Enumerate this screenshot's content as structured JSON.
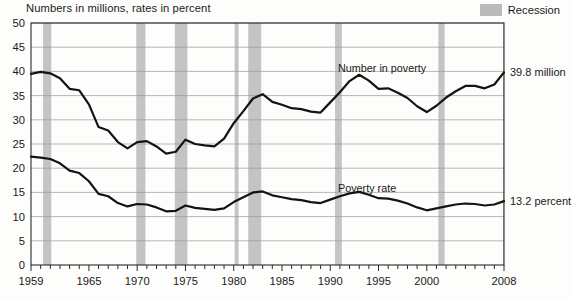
{
  "header": {
    "axis_note": "Numbers in millions, rates in percent",
    "legend": {
      "label": "Recession",
      "swatch_color": "#c2c4c6"
    }
  },
  "annotations": {
    "series1_label": "Number in poverty",
    "series1_end_label": "39.8 million",
    "series2_label": "Poverty rate",
    "series2_end_label": "13.2 percent"
  },
  "chart_data": {
    "type": "line",
    "title": "Numbers in millions, rates in percent",
    "xlabel": "",
    "ylabel": "",
    "ylim": [
      0,
      50
    ],
    "xlim": [
      1959,
      2008
    ],
    "yticks": [
      0,
      5,
      10,
      15,
      20,
      25,
      30,
      35,
      40,
      45,
      50
    ],
    "xticks": [
      1959,
      1965,
      1970,
      1975,
      1980,
      1985,
      1990,
      1995,
      2000,
      2008
    ],
    "xtick_labels": [
      "1959",
      "1965",
      "1970",
      "1975",
      "1980",
      "1985",
      "1990",
      "1995",
      "2000",
      "2008"
    ],
    "grid": true,
    "legend_position": "top-right",
    "x": [
      1959,
      1960,
      1961,
      1962,
      1963,
      1964,
      1965,
      1966,
      1967,
      1968,
      1969,
      1970,
      1971,
      1972,
      1973,
      1974,
      1975,
      1976,
      1977,
      1978,
      1979,
      1980,
      1981,
      1982,
      1983,
      1984,
      1985,
      1986,
      1987,
      1988,
      1989,
      1990,
      1991,
      1992,
      1993,
      1994,
      1995,
      1996,
      1997,
      1998,
      1999,
      2000,
      2001,
      2002,
      2003,
      2004,
      2005,
      2006,
      2007,
      2008
    ],
    "series": [
      {
        "name": "Number in poverty",
        "units": "millions",
        "end_value": 39.8,
        "values": [
          39.5,
          39.9,
          39.6,
          38.6,
          36.4,
          36.1,
          33.2,
          28.5,
          27.8,
          25.4,
          24.1,
          25.4,
          25.6,
          24.5,
          23.0,
          23.4,
          25.9,
          25.0,
          24.7,
          24.5,
          26.1,
          29.3,
          31.8,
          34.4,
          35.3,
          33.7,
          33.1,
          32.4,
          32.2,
          31.7,
          31.5,
          33.6,
          35.7,
          38.0,
          39.3,
          38.1,
          36.4,
          36.5,
          35.6,
          34.5,
          32.8,
          31.6,
          32.9,
          34.6,
          35.9,
          37.0,
          37.0,
          36.5,
          37.3,
          39.8
        ]
      },
      {
        "name": "Poverty rate",
        "units": "percent",
        "end_value": 13.2,
        "values": [
          22.4,
          22.2,
          21.9,
          21.0,
          19.5,
          19.0,
          17.3,
          14.7,
          14.2,
          12.8,
          12.1,
          12.6,
          12.5,
          11.9,
          11.1,
          11.2,
          12.3,
          11.8,
          11.6,
          11.4,
          11.7,
          13.0,
          14.0,
          15.0,
          15.2,
          14.4,
          14.0,
          13.6,
          13.4,
          13.0,
          12.8,
          13.5,
          14.2,
          14.8,
          15.1,
          14.5,
          13.8,
          13.7,
          13.3,
          12.7,
          11.9,
          11.3,
          11.7,
          12.1,
          12.5,
          12.7,
          12.6,
          12.3,
          12.5,
          13.2
        ]
      }
    ],
    "recession_bands": [
      {
        "start": 1960.25,
        "end": 1961.1
      },
      {
        "start": 1969.9,
        "end": 1970.85
      },
      {
        "start": 1973.9,
        "end": 1975.2
      },
      {
        "start": 1980.1,
        "end": 1980.5
      },
      {
        "start": 1981.5,
        "end": 1982.85
      },
      {
        "start": 1990.5,
        "end": 1991.2
      },
      {
        "start": 2001.2,
        "end": 2001.85
      },
      {
        "start": 2007.9,
        "end": 2008.6
      }
    ]
  }
}
